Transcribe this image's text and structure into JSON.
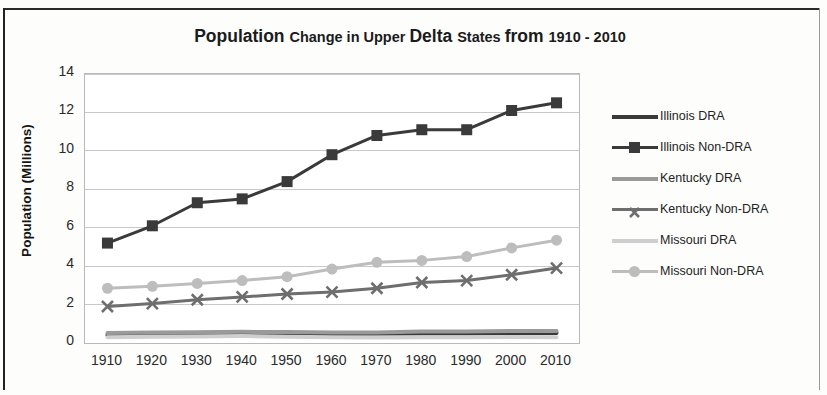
{
  "title": {
    "part1": "Population ",
    "part2": "Change in Upper ",
    "part3": "Delta ",
    "part4": "States ",
    "part5": "from ",
    "part6": "1910 - 2010",
    "full": "Population Change in Upper Delta States from 1910 - 2010"
  },
  "axes": {
    "ylabel": "Population (Millions)",
    "xlabel": ""
  },
  "legend": {
    "items": [
      {
        "label": "Illinois DRA",
        "color": "#3a3a3a",
        "marker": "none"
      },
      {
        "label": "Illinois Non-DRA",
        "color": "#3a3a3a",
        "marker": "square"
      },
      {
        "label": "Kentucky DRA",
        "color": "#9a9a9a",
        "marker": "none"
      },
      {
        "label": "Kentucky Non-DRA",
        "color": "#6e6e6e",
        "marker": "x"
      },
      {
        "label": "Missouri DRA",
        "color": "#cfcfcf",
        "marker": "none"
      },
      {
        "label": "Missouri Non-DRA",
        "color": "#bdbdbd",
        "marker": "circle"
      }
    ]
  },
  "chart_data": {
    "type": "line",
    "title": "Population Change in Upper Delta States from 1910 - 2010",
    "xlabel": "",
    "ylabel": "Population (Millions)",
    "x": [
      1910,
      1920,
      1930,
      1940,
      1950,
      1960,
      1970,
      1980,
      1990,
      2000,
      2010
    ],
    "xtick_labels": [
      "1910",
      "1920",
      "1930",
      "1940",
      "1950",
      "1960",
      "1970",
      "1980",
      "1990",
      "2000",
      "2010"
    ],
    "ytick_labels": [
      "0",
      "2",
      "4",
      "6",
      "8",
      "10",
      "12",
      "14"
    ],
    "yticks": [
      0,
      2,
      4,
      6,
      8,
      10,
      12,
      14
    ],
    "ylim": [
      0,
      14
    ],
    "grid": "horizontal",
    "legend_position": "right",
    "series": [
      {
        "name": "Illinois DRA",
        "color": "#3a3a3a",
        "marker": "none",
        "values": [
          0.42,
          0.44,
          0.45,
          0.46,
          0.47,
          0.47,
          0.48,
          0.5,
          0.5,
          0.52,
          0.52
        ]
      },
      {
        "name": "Illinois Non-DRA",
        "color": "#3a3a3a",
        "marker": "square",
        "values": [
          5.2,
          6.1,
          7.3,
          7.5,
          8.4,
          9.8,
          10.8,
          11.1,
          11.1,
          12.1,
          12.5
        ]
      },
      {
        "name": "Kentucky DRA",
        "color": "#9a9a9a",
        "marker": "none",
        "values": [
          0.52,
          0.55,
          0.56,
          0.58,
          0.57,
          0.55,
          0.55,
          0.6,
          0.6,
          0.62,
          0.63
        ]
      },
      {
        "name": "Kentucky Non-DRA",
        "color": "#6e6e6e",
        "marker": "x",
        "values": [
          1.9,
          2.05,
          2.25,
          2.4,
          2.55,
          2.65,
          2.85,
          3.15,
          3.25,
          3.55,
          3.9
        ]
      },
      {
        "name": "Missouri DRA",
        "color": "#cfcfcf",
        "marker": "none",
        "values": [
          0.3,
          0.33,
          0.34,
          0.36,
          0.33,
          0.3,
          0.29,
          0.3,
          0.3,
          0.31,
          0.3
        ]
      },
      {
        "name": "Missouri Non-DRA",
        "color": "#bdbdbd",
        "marker": "circle",
        "values": [
          2.85,
          2.95,
          3.1,
          3.25,
          3.45,
          3.85,
          4.2,
          4.3,
          4.5,
          4.95,
          5.35
        ]
      }
    ]
  }
}
